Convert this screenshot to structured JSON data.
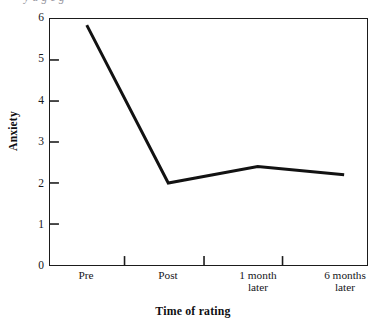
{
  "figure": {
    "clipped_caption": "y a  g    e   g",
    "background_color": "#ffffff",
    "line_color": "#121212",
    "axis_color": "#1b1b1b"
  },
  "chart_data": {
    "type": "line",
    "title": "",
    "xlabel": "Time of rating",
    "ylabel": "Anxiety",
    "categories": [
      "Pre",
      "Post",
      "1 month\nlater",
      "6 months\nlater"
    ],
    "category_labels_flat": [
      "Pre",
      "Post",
      "1 month later",
      "6 months later"
    ],
    "values": [
      5.85,
      2.0,
      2.4,
      2.2
    ],
    "series": [
      {
        "name": "Anxiety",
        "values": [
          5.85,
          2.0,
          2.4,
          2.2
        ]
      }
    ],
    "ylim": [
      0,
      6
    ],
    "yticks": [
      0,
      1,
      2,
      3,
      4,
      5,
      6
    ],
    "ytick_labels": [
      "0",
      "1",
      "2",
      "3",
      "4",
      "5",
      "6"
    ],
    "grid": false,
    "legend": "none",
    "markers": false,
    "tick_direction": "in",
    "frame": "box"
  }
}
